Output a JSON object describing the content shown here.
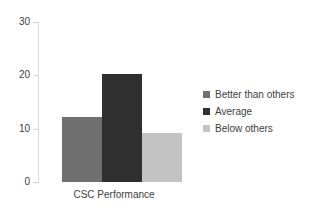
{
  "chart_data": {
    "type": "bar",
    "title": "",
    "subtitle": "",
    "xlabel": "CSC Performance",
    "ylabel": "",
    "categories": [
      "CSC Performance"
    ],
    "ylim": [
      0,
      30
    ],
    "yticks": [
      0,
      10,
      20,
      30
    ],
    "ytick_labels": [
      "0",
      "10",
      "20",
      "30"
    ],
    "grid": false,
    "legend_position": "right",
    "series": [
      {
        "name": "Better than others",
        "values": [
          12.2
        ],
        "color": "#6f6f6f"
      },
      {
        "name": "Average",
        "values": [
          20.2
        ],
        "color": "#2f2f2f"
      },
      {
        "name": "Below others",
        "values": [
          9.2
        ],
        "color": "#c3c3c3"
      }
    ]
  },
  "axis": {
    "line_color": "#d9d9d9",
    "tick_color": "#d9d9d9",
    "text_color": "#404040"
  },
  "legend": {
    "items": [
      {
        "label": "Better than others",
        "color": "#6f6f6f"
      },
      {
        "label": "Average",
        "color": "#2f2f2f"
      },
      {
        "label": "Below others",
        "color": "#c3c3c3"
      }
    ]
  }
}
